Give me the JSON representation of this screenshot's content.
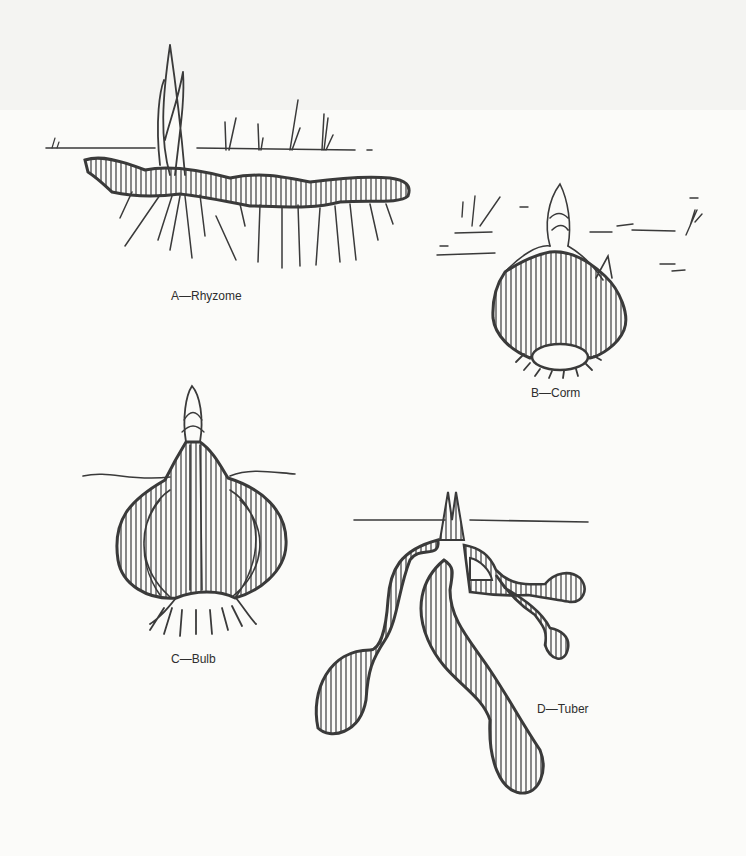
{
  "figure": {
    "panels": [
      {
        "id": "A",
        "label": "A—Rhyzome"
      },
      {
        "id": "B",
        "label": "B—Corm"
      },
      {
        "id": "C",
        "label": "C—Bulb"
      },
      {
        "id": "D",
        "label": "D—Tuber"
      }
    ]
  },
  "colors": {
    "ink": "#3a3a3a",
    "paper": "#fbfbf9"
  }
}
